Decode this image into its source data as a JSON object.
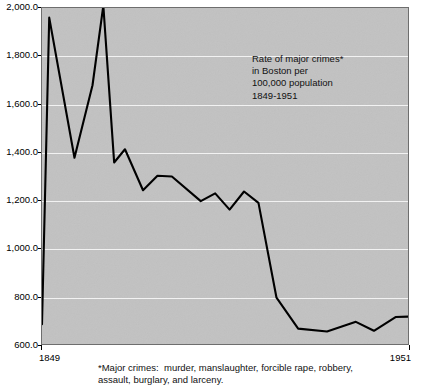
{
  "figure": {
    "background_color": "#ffffff",
    "plot_background_color": "#c2c2c2",
    "gridline_color": "#f2f2f2",
    "series_color": "#000000",
    "annotation": "Rate of major crimes*\nin Boston per\n100,000 population\n1849-1951",
    "footnote": "*Major crimes:  murder, manslaughter, forcible rape, robbery,\nassault, burglary, and larceny."
  },
  "chart_data": {
    "type": "line",
    "title": "",
    "subtitle": "",
    "annotation": "Rate of major crimes* in Boston per 100,000 population 1849-1951",
    "footnote": "*Major crimes:  murder, manslaughter, forcible rape, robbery, assault, burglary, and larceny.",
    "xlabel": "",
    "ylabel": "",
    "xlim": [
      1849,
      1951
    ],
    "ylim": [
      600,
      2000
    ],
    "grid": true,
    "legend": "none",
    "x_tick_labels": [
      "1849",
      "1951"
    ],
    "x_tick_values": [
      1849,
      1951
    ],
    "y_tick_labels": [
      "600.0",
      "800.0",
      "1,000.0",
      "1,200.0",
      "1,400.0",
      "1,600.0",
      "1,800.0",
      "2,000.0"
    ],
    "y_tick_values": [
      600,
      800,
      1000,
      1200,
      1400,
      1600,
      1800,
      2000
    ],
    "series": [
      {
        "name": "Rate of major crimes per 100,000 population",
        "x": [
          1849,
          1854,
          1859,
          1864,
          1869,
          1874,
          1879,
          1884,
          1889,
          1894,
          1899,
          1904,
          1909,
          1914,
          1919,
          1924,
          1929,
          1934,
          1939,
          1944,
          1949,
          1951
        ],
        "values": [
          690,
          1960,
          1380,
          1680,
          2010,
          1360,
          1415,
          1245,
          1305,
          1165,
          1190,
          1130,
          1085,
          995,
          800,
          665,
          670,
          655,
          700,
          680,
          718,
          720
        ]
      }
    ],
    "points": [
      {
        "x": 1849,
        "y": 690
      },
      {
        "x": 1851,
        "y": 1960
      },
      {
        "x": 1858,
        "y": 1380
      },
      {
        "x": 1863,
        "y": 1680
      },
      {
        "x": 1866,
        "y": 2010
      },
      {
        "x": 1869,
        "y": 1360
      },
      {
        "x": 1872,
        "y": 1415
      },
      {
        "x": 1877,
        "y": 1245
      },
      {
        "x": 1881,
        "y": 1305
      },
      {
        "x": 1885,
        "y": 1302
      },
      {
        "x": 1893,
        "y": 1200
      },
      {
        "x": 1897,
        "y": 1232
      },
      {
        "x": 1901,
        "y": 1165
      },
      {
        "x": 1905,
        "y": 1240
      },
      {
        "x": 1909,
        "y": 1193
      },
      {
        "x": 1914,
        "y": 800
      },
      {
        "x": 1920,
        "y": 672
      },
      {
        "x": 1928,
        "y": 660
      },
      {
        "x": 1936,
        "y": 700
      },
      {
        "x": 1941,
        "y": 663
      },
      {
        "x": 1947,
        "y": 720
      },
      {
        "x": 1951,
        "y": 722
      }
    ]
  }
}
